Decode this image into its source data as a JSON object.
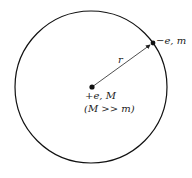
{
  "diagram": {
    "orbit": {
      "cx": 91,
      "cy": 87,
      "r": 76,
      "stroke": "#111111"
    },
    "nucleus": {
      "x": 92,
      "y": 87,
      "label_line1": "+e, M",
      "label_line2": "(M >> m)"
    },
    "electron": {
      "x": 153,
      "y": 43,
      "label": "−e, m"
    },
    "radius_label": "r"
  }
}
